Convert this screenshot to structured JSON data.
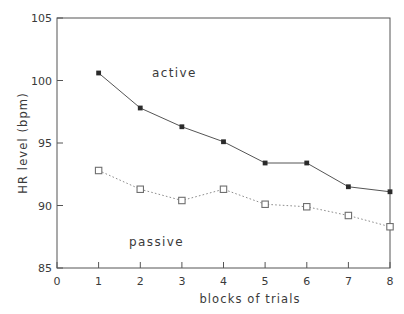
{
  "chart_data": {
    "type": "line",
    "title": "",
    "xlabel": "blocks of trials",
    "ylabel": "HR level (bpm)",
    "x": [
      1,
      2,
      3,
      4,
      5,
      6,
      7,
      8
    ],
    "xlim": [
      0,
      8
    ],
    "ylim": [
      85,
      105
    ],
    "xticks": [
      "0",
      "1",
      "2",
      "3",
      "4",
      "5",
      "6",
      "7",
      "8"
    ],
    "yticks": [
      "85",
      "90",
      "95",
      "100",
      "105"
    ],
    "grid": false,
    "legend_position": "inline-annotation",
    "series": [
      {
        "name": "active",
        "marker": "filled-square",
        "linestyle": "solid",
        "color": "#2b2b2b",
        "values": [
          100.6,
          97.8,
          96.3,
          95.1,
          93.4,
          93.4,
          91.5,
          91.1
        ]
      },
      {
        "name": "passive",
        "marker": "open-square",
        "linestyle": "dotted",
        "color": "#6f6f6f",
        "values": [
          92.8,
          91.3,
          90.4,
          91.3,
          90.1,
          89.9,
          89.2,
          88.3
        ]
      }
    ],
    "annotations": [
      {
        "text": "active",
        "x": 2.3,
        "y": 101.2
      },
      {
        "text": "passive",
        "x": 2.4,
        "y": 87.2
      }
    ]
  },
  "axes": {
    "x_title": "blocks of trials",
    "y_title": "HR level (bpm)"
  },
  "labels": {
    "active": "active",
    "passive": "passive",
    "y_105": "105",
    "y_100": "100",
    "y_95": "95",
    "y_90": "90",
    "y_85": "85",
    "x_0": "0",
    "x_1": "1",
    "x_2": "2",
    "x_3": "3",
    "x_4": "4",
    "x_5": "5",
    "x_6": "6",
    "x_7": "7",
    "x_8": "8"
  }
}
